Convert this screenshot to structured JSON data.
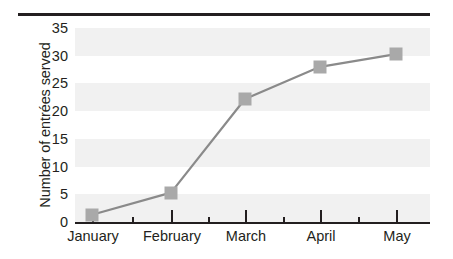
{
  "chart_data": {
    "type": "line",
    "title": "",
    "xlabel": "",
    "ylabel": "Number of entrées served",
    "categories": [
      "January",
      "February",
      "March",
      "April",
      "May"
    ],
    "values": [
      1.3,
      5.3,
      22.2,
      28.0,
      30.3
    ],
    "series": [
      {
        "name": "Entrées served",
        "values": [
          1.3,
          5.3,
          22.2,
          28.0,
          30.3
        ]
      }
    ],
    "ylim": [
      0,
      35
    ],
    "yticks": [
      0,
      5,
      10,
      15,
      20,
      25,
      30,
      35
    ],
    "ytick_labels": [
      "0",
      "5",
      "10",
      "15",
      "20",
      "25",
      "30",
      "35"
    ],
    "xtick_labels": [
      "January",
      "February",
      "March",
      "April",
      "May"
    ],
    "grid": "horizontal-alternating-bands",
    "legend": "none",
    "marker": "square",
    "colors": {
      "marker": "#a9a9a9",
      "line": "#8a8a8a",
      "band": "#f1f1f1",
      "axis": "#231f20",
      "text": "#231f20",
      "background": "#ffffff"
    }
  },
  "axis": {
    "y_label": "Number of entrées served",
    "y_ticks": [
      "35",
      "30",
      "25",
      "20",
      "15",
      "10",
      "5",
      "0"
    ],
    "x_ticks": [
      "January",
      "February",
      "March",
      "April",
      "May"
    ]
  }
}
